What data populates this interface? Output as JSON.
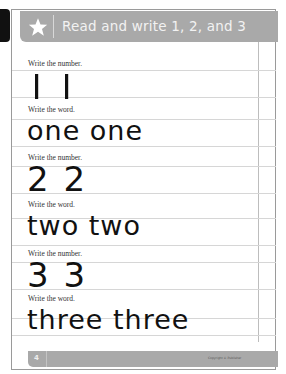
{
  "header": {
    "title": "Read and write 1, 2, and 3",
    "icon": "star-icon",
    "band_color": "#a9a9a9"
  },
  "sections": [
    {
      "label": "Write the number.",
      "content": "1  1",
      "type": "number"
    },
    {
      "label": "Write the word.",
      "content": "one  one",
      "type": "word"
    },
    {
      "label": "Write the number.",
      "content": "2  2",
      "type": "number"
    },
    {
      "label": "Write the word.",
      "content": "two  two",
      "type": "word"
    },
    {
      "label": "Write the number.",
      "content": "3  3",
      "type": "number"
    },
    {
      "label": "Write the word.",
      "content": "three  three",
      "type": "word"
    }
  ],
  "footer": {
    "page_number": "4",
    "copyright": "Copyright © Publisher"
  }
}
